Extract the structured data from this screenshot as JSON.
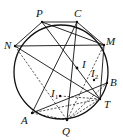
{
  "diagram": {
    "type": "geometry-circle-figure",
    "circle": {
      "cx": 61,
      "cy": 72,
      "r": 47
    },
    "points": {
      "P": {
        "x": 42,
        "y": 22,
        "label": "P",
        "lx": 36,
        "ly": 17
      },
      "C": {
        "x": 77,
        "y": 22,
        "label": "C",
        "lx": 74,
        "ly": 17
      },
      "N": {
        "x": 15,
        "y": 46,
        "label": "N",
        "lx": 4,
        "ly": 49
      },
      "M": {
        "x": 104,
        "y": 45,
        "label": "M",
        "lx": 106,
        "ly": 45
      },
      "B": {
        "x": 107,
        "y": 83,
        "label": "B",
        "lx": 110,
        "ly": 86
      },
      "T": {
        "x": 100,
        "y": 99,
        "label": "T",
        "lx": 104,
        "ly": 108
      },
      "Q": {
        "x": 67,
        "y": 120,
        "label": "Q",
        "lx": 62,
        "ly": 135
      },
      "A": {
        "x": 32,
        "y": 113,
        "label": "A",
        "lx": 21,
        "ly": 124
      },
      "I": {
        "x": 77,
        "y": 68,
        "label": "I",
        "lx": 82,
        "ly": 68
      },
      "I1": {
        "x": 60,
        "y": 96,
        "label": "I",
        "sub": "1",
        "lx": 51,
        "ly": 97
      },
      "I2": {
        "x": 94,
        "y": 80,
        "label": "I",
        "sub": "2",
        "lx": 91,
        "ly": 77
      }
    },
    "solid_segments": [
      [
        "P",
        "C"
      ],
      [
        "P",
        "N"
      ],
      [
        "P",
        "M"
      ],
      [
        "P",
        "T"
      ],
      [
        "C",
        "M"
      ],
      [
        "N",
        "M"
      ],
      [
        "N",
        "T"
      ],
      [
        "C",
        "A"
      ],
      [
        "C",
        "Q"
      ],
      [
        "A",
        "B"
      ],
      [
        "M",
        "T"
      ]
    ],
    "dashed_segments": [
      [
        "N",
        "Q"
      ],
      [
        "A",
        "Q"
      ],
      [
        "Q",
        "T"
      ],
      [
        "Q",
        "M"
      ],
      [
        "Q",
        "B"
      ],
      [
        "I1",
        "T"
      ],
      [
        "A",
        "T"
      ]
    ],
    "colors": {
      "stroke": "#111111",
      "background": "#ffffff"
    }
  }
}
